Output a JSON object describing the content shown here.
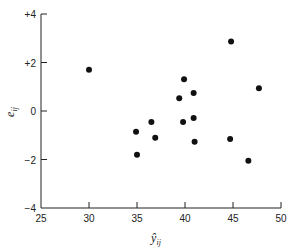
{
  "chart_data": {
    "type": "scatter",
    "title": "",
    "xlabel": "ŷ_ij",
    "ylabel": "e_ij",
    "xlim": [
      25,
      50
    ],
    "ylim": [
      -4,
      4
    ],
    "x_ticks": [
      25,
      30,
      35,
      40,
      45,
      50
    ],
    "x_tick_labels": [
      "25",
      "30",
      "35",
      "40",
      "45",
      "50"
    ],
    "y_ticks": [
      -4,
      -2,
      0,
      2,
      4
    ],
    "y_tick_labels": [
      "−4",
      "−2",
      "0",
      "+2",
      "+4"
    ],
    "grid": false,
    "legend": null,
    "points": [
      {
        "x": 30.0,
        "y": 1.7
      },
      {
        "x": 34.9,
        "y": -0.86
      },
      {
        "x": 35.0,
        "y": -1.8
      },
      {
        "x": 36.5,
        "y": -0.45
      },
      {
        "x": 36.9,
        "y": -1.1
      },
      {
        "x": 39.4,
        "y": 0.53
      },
      {
        "x": 39.8,
        "y": -0.45
      },
      {
        "x": 39.9,
        "y": 1.31
      },
      {
        "x": 40.9,
        "y": 0.74
      },
      {
        "x": 40.9,
        "y": -0.29
      },
      {
        "x": 41.0,
        "y": -1.27
      },
      {
        "x": 44.7,
        "y": -1.15
      },
      {
        "x": 44.8,
        "y": 2.87
      },
      {
        "x": 46.6,
        "y": -2.05
      },
      {
        "x": 47.7,
        "y": 0.94
      }
    ],
    "marker_color": "#111111",
    "axis_color": "#222222"
  },
  "labels": {
    "x_main": "ŷ",
    "x_sub": "ij",
    "y_main": "e",
    "y_sub": "ij"
  }
}
